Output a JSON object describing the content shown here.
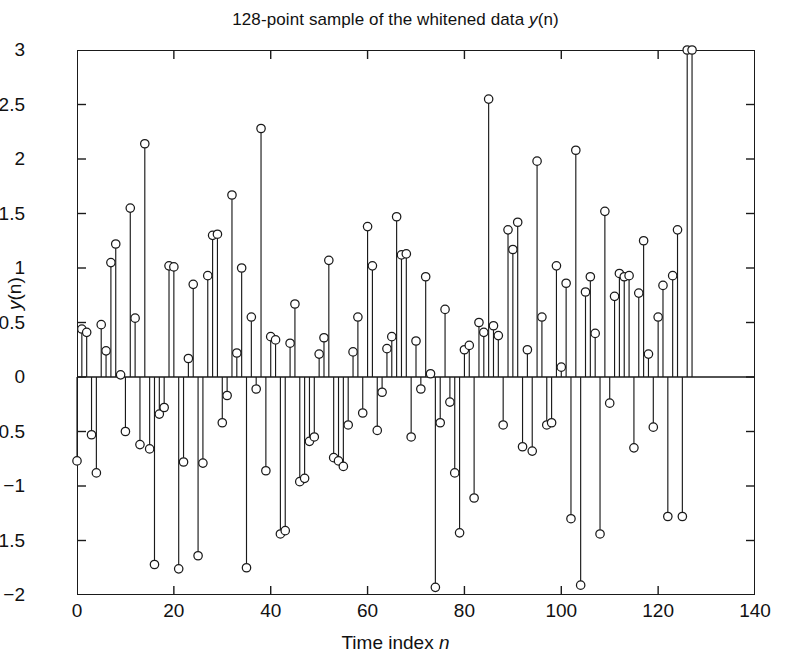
{
  "figure": {
    "title_prefix": "128-point sample of the whitened data ",
    "title_var": "y",
    "title_suffix": "(n)",
    "background": "#ffffff",
    "ink_color": "#1a1a1a"
  },
  "axis": {
    "ylabel_var": "y",
    "ylabel_suffix": "(n)",
    "xlabel_prefix": "Time index ",
    "xlabel_var": "n",
    "ytick_labels": [
      "3",
      "2.5",
      "2",
      "1.5",
      "1",
      "0.5",
      "0",
      "-0.5",
      "-1",
      "-1.5",
      "-2"
    ],
    "xtick_labels": [
      "0",
      "20",
      "40",
      "60",
      "80",
      "100",
      "120",
      "140"
    ]
  },
  "chart_data": {
    "type": "scatter",
    "plot_style": "stem",
    "title": "128-point sample of the whitened data y(n)",
    "xlabel": "Time index n",
    "ylabel": "y(n)",
    "xlim": [
      0,
      140
    ],
    "ylim": [
      -2,
      3
    ],
    "xticks": [
      0,
      20,
      40,
      60,
      80,
      100,
      120,
      140
    ],
    "yticks": [
      -2,
      -1.5,
      -1,
      -0.5,
      0,
      0.5,
      1,
      1.5,
      2,
      2.5,
      3
    ],
    "grid": false,
    "legend": null,
    "marker": "open-circle",
    "baseline": 0,
    "n_points": 128,
    "x": [
      0,
      1,
      2,
      3,
      4,
      5,
      6,
      7,
      8,
      9,
      10,
      11,
      12,
      13,
      14,
      15,
      16,
      17,
      18,
      19,
      20,
      21,
      22,
      23,
      24,
      25,
      26,
      27,
      28,
      29,
      30,
      31,
      32,
      33,
      34,
      35,
      36,
      37,
      38,
      39,
      40,
      41,
      42,
      43,
      44,
      45,
      46,
      47,
      48,
      49,
      50,
      51,
      52,
      53,
      54,
      55,
      56,
      57,
      58,
      59,
      60,
      61,
      62,
      63,
      64,
      65,
      66,
      67,
      68,
      69,
      70,
      71,
      72,
      73,
      74,
      75,
      76,
      77,
      78,
      79,
      80,
      81,
      82,
      83,
      84,
      85,
      86,
      87,
      88,
      89,
      90,
      91,
      92,
      93,
      94,
      95,
      96,
      97,
      98,
      99,
      100,
      101,
      102,
      103,
      104,
      105,
      106,
      107,
      108,
      109,
      110,
      111,
      112,
      113,
      114,
      115,
      116,
      117,
      118,
      119,
      120,
      121,
      122,
      123,
      124,
      125,
      126,
      127
    ],
    "y": [
      -0.77,
      0.44,
      0.41,
      -0.53,
      -0.88,
      0.48,
      0.24,
      1.05,
      1.22,
      0.02,
      -0.5,
      1.55,
      0.54,
      -0.62,
      2.14,
      -0.66,
      -1.72,
      -0.34,
      -0.28,
      1.02,
      1.01,
      -1.76,
      -0.78,
      0.17,
      0.85,
      -1.64,
      -0.79,
      0.93,
      1.3,
      1.31,
      -0.42,
      -0.17,
      1.67,
      0.22,
      1.0,
      -1.75,
      0.55,
      -0.11,
      2.28,
      -0.86,
      0.37,
      0.34,
      -1.44,
      -1.41,
      0.31,
      0.67,
      -0.96,
      -0.93,
      -0.59,
      -0.55,
      0.21,
      0.36,
      1.07,
      -0.74,
      -0.77,
      -0.82,
      -0.44,
      0.23,
      0.55,
      -0.33,
      1.38,
      1.02,
      -0.49,
      -0.14,
      0.26,
      0.37,
      1.47,
      1.12,
      1.13,
      -0.55,
      0.33,
      -0.11,
      0.92,
      0.03,
      -1.93,
      -0.42,
      0.62,
      -0.23,
      -0.88,
      -1.43,
      0.25,
      0.29,
      -1.11,
      0.5,
      0.41,
      2.55,
      0.47,
      0.38,
      -0.44,
      1.35,
      1.17,
      1.42,
      -0.64,
      0.25,
      -0.68,
      1.98,
      0.55,
      -0.44,
      -0.42,
      1.02,
      0.09,
      0.86,
      -1.3,
      2.08,
      -1.91,
      0.78,
      0.92,
      0.4,
      -1.44,
      1.52,
      -0.24,
      0.74,
      0.95,
      0.92,
      0.93,
      -0.65,
      0.77,
      1.25,
      0.21,
      -0.46,
      0.55,
      0.84,
      -1.28,
      0.93,
      1.35,
      -1.28
    ]
  }
}
